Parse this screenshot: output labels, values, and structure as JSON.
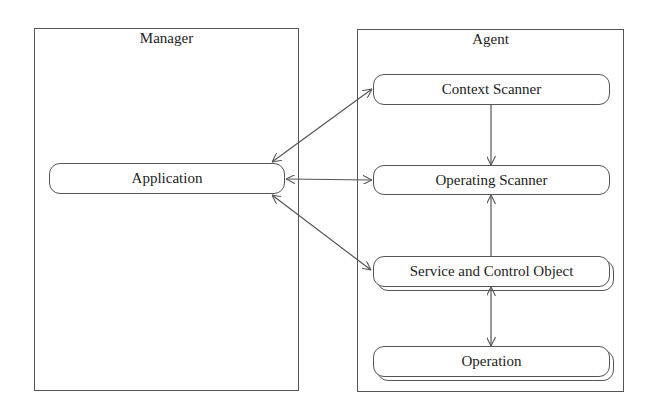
{
  "diagram": {
    "manager": {
      "title": "Manager",
      "nodes": [
        {
          "id": "application",
          "label": "Application"
        }
      ]
    },
    "agent": {
      "title": "Agent",
      "nodes": [
        {
          "id": "context_scanner",
          "label": "Context Scanner"
        },
        {
          "id": "operating_scanner",
          "label": "Operating Scanner"
        },
        {
          "id": "service_control",
          "label": "Service and Control Object",
          "stacked": true
        },
        {
          "id": "operation",
          "label": "Operation",
          "stacked": true
        }
      ]
    },
    "edges": [
      {
        "from": "application",
        "to": "context_scanner",
        "direction": "both"
      },
      {
        "from": "application",
        "to": "operating_scanner",
        "direction": "both"
      },
      {
        "from": "application",
        "to": "service_control",
        "direction": "both"
      },
      {
        "from": "context_scanner",
        "to": "operating_scanner",
        "direction": "forward"
      },
      {
        "from": "service_control",
        "to": "operating_scanner",
        "direction": "forward"
      },
      {
        "from": "service_control",
        "to": "operation",
        "direction": "both"
      }
    ],
    "line_color": "#555555"
  }
}
